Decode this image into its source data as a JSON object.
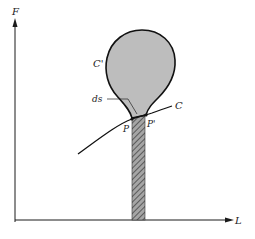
{
  "figure": {
    "axes": {
      "y_label": "F",
      "x_label": "L"
    },
    "labels": {
      "region": "C'",
      "curve": "C",
      "element": "ds",
      "point_left": "P",
      "point_right": "P'"
    },
    "colors": {
      "ink": "#1a1a1a",
      "region_fill": "#bdbdbd",
      "hatch": "#444444",
      "column_fill": "#9a9a9a"
    }
  }
}
